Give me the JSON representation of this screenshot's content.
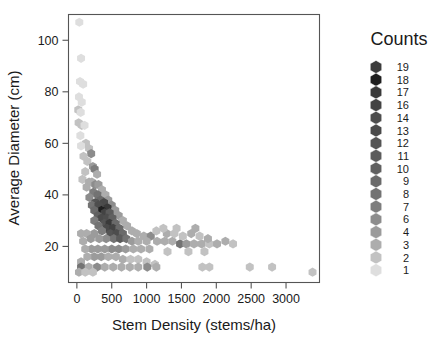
{
  "chart_data": {
    "type": "scatter",
    "title": "",
    "xlabel": "Stem Density (stems/ha)",
    "ylabel": "Average Diameter (cm)",
    "xlim": [
      -120,
      3480
    ],
    "ylim": [
      6,
      110
    ],
    "xticks": [
      0,
      500,
      1000,
      1500,
      2000,
      2500,
      3000
    ],
    "xticklabels": [
      "0",
      "500",
      "1000",
      "1500",
      "2000",
      "2500",
      "3000"
    ],
    "yticks": [
      20,
      40,
      60,
      80,
      100
    ],
    "yticklabels": [
      "20",
      "40",
      "60",
      "80",
      "100"
    ],
    "grid": false,
    "binning": "hexbin",
    "legend": {
      "title": "Counts",
      "position": "right",
      "labels": [
        "19",
        "18",
        "17",
        "16",
        "14",
        "13",
        "12",
        "11",
        "10",
        "9",
        "8",
        "7",
        "6",
        "4",
        "3",
        "2",
        "1"
      ],
      "colors": [
        "#3c3c3c",
        "#1f1f1f",
        "#3a3a3a",
        "#434343",
        "#4d4d4d",
        "#4a4a4a",
        "#545454",
        "#5b5b5b",
        "#606060",
        "#6a6a6a",
        "#737373",
        "#7d7d7d",
        "#8c8c8c",
        "#9b9b9b",
        "#adadad",
        "#c2c2c2",
        "#dedede"
      ]
    },
    "points": [
      {
        "x": 35,
        "y": 107,
        "c": 1
      },
      {
        "x": 60,
        "y": 93,
        "c": 1
      },
      {
        "x": 45,
        "y": 84,
        "c": 1
      },
      {
        "x": 90,
        "y": 83,
        "c": 1
      },
      {
        "x": 30,
        "y": 78,
        "c": 1
      },
      {
        "x": 70,
        "y": 76,
        "c": 1
      },
      {
        "x": 20,
        "y": 73,
        "c": 2
      },
      {
        "x": 55,
        "y": 72,
        "c": 1
      },
      {
        "x": 25,
        "y": 68,
        "c": 2
      },
      {
        "x": 70,
        "y": 67,
        "c": 2
      },
      {
        "x": 110,
        "y": 67,
        "c": 1
      },
      {
        "x": 50,
        "y": 63,
        "c": 1
      },
      {
        "x": 130,
        "y": 60,
        "c": 2
      },
      {
        "x": 60,
        "y": 59,
        "c": 1
      },
      {
        "x": 175,
        "y": 58,
        "c": 2
      },
      {
        "x": 205,
        "y": 56,
        "c": 6
      },
      {
        "x": 95,
        "y": 55,
        "c": 2
      },
      {
        "x": 150,
        "y": 53,
        "c": 2
      },
      {
        "x": 230,
        "y": 51,
        "c": 4
      },
      {
        "x": 255,
        "y": 50,
        "c": 7
      },
      {
        "x": 120,
        "y": 49,
        "c": 2
      },
      {
        "x": 290,
        "y": 48,
        "c": 3
      },
      {
        "x": 80,
        "y": 46,
        "c": 2
      },
      {
        "x": 175,
        "y": 45,
        "c": 3
      },
      {
        "x": 215,
        "y": 45,
        "c": 3
      },
      {
        "x": 265,
        "y": 44,
        "c": 6
      },
      {
        "x": 310,
        "y": 44,
        "c": 4
      },
      {
        "x": 140,
        "y": 43,
        "c": 3
      },
      {
        "x": 360,
        "y": 42,
        "c": 3
      },
      {
        "x": 235,
        "y": 41,
        "c": 7
      },
      {
        "x": 300,
        "y": 40,
        "c": 8
      },
      {
        "x": 410,
        "y": 40,
        "c": 3
      },
      {
        "x": 180,
        "y": 39,
        "c": 6
      },
      {
        "x": 340,
        "y": 38,
        "c": 9
      },
      {
        "x": 450,
        "y": 38,
        "c": 4
      },
      {
        "x": 265,
        "y": 37,
        "c": 12
      },
      {
        "x": 390,
        "y": 37,
        "c": 13
      },
      {
        "x": 215,
        "y": 36,
        "c": 8
      },
      {
        "x": 310,
        "y": 36,
        "c": 14
      },
      {
        "x": 500,
        "y": 36,
        "c": 6
      },
      {
        "x": 440,
        "y": 35,
        "c": 17
      },
      {
        "x": 355,
        "y": 34,
        "c": 18
      },
      {
        "x": 250,
        "y": 34,
        "c": 9
      },
      {
        "x": 550,
        "y": 34,
        "c": 4
      },
      {
        "x": 400,
        "y": 33,
        "c": 16
      },
      {
        "x": 470,
        "y": 33,
        "c": 11
      },
      {
        "x": 300,
        "y": 32,
        "c": 10
      },
      {
        "x": 600,
        "y": 32,
        "c": 4
      },
      {
        "x": 355,
        "y": 31,
        "c": 13
      },
      {
        "x": 430,
        "y": 31,
        "c": 14
      },
      {
        "x": 510,
        "y": 31,
        "c": 10
      },
      {
        "x": 250,
        "y": 30,
        "c": 7
      },
      {
        "x": 660,
        "y": 30,
        "c": 3
      },
      {
        "x": 395,
        "y": 29,
        "c": 12
      },
      {
        "x": 470,
        "y": 29,
        "c": 17
      },
      {
        "x": 555,
        "y": 29,
        "c": 9
      },
      {
        "x": 310,
        "y": 28,
        "c": 8
      },
      {
        "x": 720,
        "y": 28,
        "c": 3
      },
      {
        "x": 430,
        "y": 27,
        "c": 13
      },
      {
        "x": 520,
        "y": 27,
        "c": 16
      },
      {
        "x": 610,
        "y": 27,
        "c": 9
      },
      {
        "x": 360,
        "y": 26,
        "c": 7
      },
      {
        "x": 790,
        "y": 26,
        "c": 3
      },
      {
        "x": 480,
        "y": 25,
        "c": 12
      },
      {
        "x": 570,
        "y": 25,
        "c": 14
      },
      {
        "x": 660,
        "y": 25,
        "c": 9
      },
      {
        "x": 250,
        "y": 25,
        "c": 4
      },
      {
        "x": 860,
        "y": 25,
        "c": 3
      },
      {
        "x": 140,
        "y": 25,
        "c": 3
      },
      {
        "x": 60,
        "y": 25,
        "c": 3
      },
      {
        "x": 960,
        "y": 24,
        "c": 3
      },
      {
        "x": 1060,
        "y": 24,
        "c": 6
      },
      {
        "x": 530,
        "y": 23,
        "c": 8
      },
      {
        "x": 620,
        "y": 23,
        "c": 11
      },
      {
        "x": 710,
        "y": 23,
        "c": 8
      },
      {
        "x": 420,
        "y": 23,
        "c": 6
      },
      {
        "x": 320,
        "y": 23,
        "c": 4
      },
      {
        "x": 200,
        "y": 23,
        "c": 4
      },
      {
        "x": 90,
        "y": 22,
        "c": 3
      },
      {
        "x": 790,
        "y": 22,
        "c": 4
      },
      {
        "x": 880,
        "y": 22,
        "c": 3
      },
      {
        "x": 1000,
        "y": 22,
        "c": 3
      },
      {
        "x": 1150,
        "y": 22,
        "c": 3
      },
      {
        "x": 1260,
        "y": 22,
        "c": 3
      },
      {
        "x": 1370,
        "y": 22,
        "c": 3
      },
      {
        "x": 1480,
        "y": 21,
        "c": 8
      },
      {
        "x": 1570,
        "y": 21,
        "c": 4
      },
      {
        "x": 1680,
        "y": 21,
        "c": 3
      },
      {
        "x": 1790,
        "y": 21,
        "c": 3
      },
      {
        "x": 1900,
        "y": 21,
        "c": 2
      },
      {
        "x": 2010,
        "y": 21,
        "c": 3
      },
      {
        "x": 2130,
        "y": 22,
        "c": 3
      },
      {
        "x": 2240,
        "y": 21,
        "c": 2
      },
      {
        "x": 1290,
        "y": 25,
        "c": 3
      },
      {
        "x": 1400,
        "y": 25,
        "c": 2
      },
      {
        "x": 1520,
        "y": 24,
        "c": 2
      },
      {
        "x": 1640,
        "y": 25,
        "c": 3
      },
      {
        "x": 1760,
        "y": 24,
        "c": 2
      },
      {
        "x": 1880,
        "y": 23,
        "c": 3
      },
      {
        "x": 1140,
        "y": 26,
        "c": 2
      },
      {
        "x": 1240,
        "y": 27,
        "c": 2
      },
      {
        "x": 1430,
        "y": 27,
        "c": 2
      },
      {
        "x": 1700,
        "y": 27,
        "c": 3
      },
      {
        "x": 600,
        "y": 19,
        "c": 5
      },
      {
        "x": 500,
        "y": 19,
        "c": 5
      },
      {
        "x": 400,
        "y": 19,
        "c": 4
      },
      {
        "x": 300,
        "y": 19,
        "c": 4
      },
      {
        "x": 210,
        "y": 19,
        "c": 4
      },
      {
        "x": 120,
        "y": 19,
        "c": 3
      },
      {
        "x": 700,
        "y": 19,
        "c": 4
      },
      {
        "x": 810,
        "y": 19,
        "c": 3
      },
      {
        "x": 920,
        "y": 19,
        "c": 3
      },
      {
        "x": 1040,
        "y": 19,
        "c": 3
      },
      {
        "x": 1300,
        "y": 18,
        "c": 2
      },
      {
        "x": 1600,
        "y": 18,
        "c": 2
      },
      {
        "x": 1830,
        "y": 18,
        "c": 2
      },
      {
        "x": 250,
        "y": 16,
        "c": 4
      },
      {
        "x": 350,
        "y": 16,
        "c": 4
      },
      {
        "x": 450,
        "y": 16,
        "c": 3
      },
      {
        "x": 560,
        "y": 16,
        "c": 3
      },
      {
        "x": 150,
        "y": 16,
        "c": 3
      },
      {
        "x": 660,
        "y": 15,
        "c": 3
      },
      {
        "x": 770,
        "y": 15,
        "c": 2
      },
      {
        "x": 880,
        "y": 15,
        "c": 2
      },
      {
        "x": 60,
        "y": 14,
        "c": 3
      },
      {
        "x": 1000,
        "y": 14,
        "c": 2
      },
      {
        "x": 1120,
        "y": 13,
        "c": 2
      },
      {
        "x": 60,
        "y": 12,
        "c": 8
      },
      {
        "x": 170,
        "y": 12,
        "c": 3
      },
      {
        "x": 290,
        "y": 12,
        "c": 6
      },
      {
        "x": 400,
        "y": 12,
        "c": 3
      },
      {
        "x": 520,
        "y": 12,
        "c": 3
      },
      {
        "x": 640,
        "y": 12,
        "c": 3
      },
      {
        "x": 760,
        "y": 12,
        "c": 3
      },
      {
        "x": 880,
        "y": 12,
        "c": 3
      },
      {
        "x": 1010,
        "y": 12,
        "c": 6
      },
      {
        "x": 1140,
        "y": 12,
        "c": 3
      },
      {
        "x": 1800,
        "y": 12,
        "c": 2
      },
      {
        "x": 1900,
        "y": 12,
        "c": 2
      },
      {
        "x": 2480,
        "y": 12,
        "c": 2
      },
      {
        "x": 2800,
        "y": 12,
        "c": 2
      },
      {
        "x": 3380,
        "y": 10,
        "c": 2
      },
      {
        "x": 30,
        "y": 10,
        "c": 3
      },
      {
        "x": 120,
        "y": 10,
        "c": 2
      },
      {
        "x": 230,
        "y": 10,
        "c": 2
      }
    ]
  }
}
